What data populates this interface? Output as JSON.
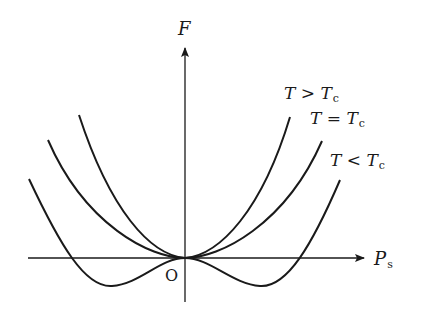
{
  "diagram": {
    "type": "free-energy-vs-polarization",
    "axes": {
      "y_label": "F",
      "x_label_main": "P",
      "x_label_sub": "s",
      "origin_label": "O"
    },
    "curves": [
      {
        "id": "above-tc",
        "label_main": "T > T",
        "label_sub": "c",
        "shape": "single minimum at origin, steep"
      },
      {
        "id": "at-tc",
        "label_main": "T = T",
        "label_sub": "c",
        "shape": "flat quartic minimum at origin"
      },
      {
        "id": "below-tc",
        "label_main": "T < T",
        "label_sub": "c",
        "shape": "double well, two symmetric minima below axis"
      }
    ],
    "colors": {
      "stroke": "#1a1a1a",
      "background": "#ffffff"
    }
  }
}
